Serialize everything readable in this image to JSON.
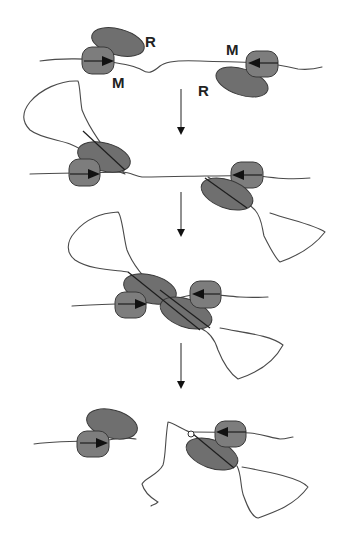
{
  "figure": {
    "type": "schematic",
    "colors": {
      "protein_fill": "#6f6f6f",
      "outline": "#3a3a3a",
      "dna": "#4a4a4a",
      "background": "#ffffff"
    },
    "labels": {
      "r_left": "R",
      "m_left": "M",
      "m_right": "M",
      "r_right": "R"
    },
    "legend": {
      "R": "restriction subunit",
      "M": "modification subunit"
    },
    "stages": [
      {
        "index": 1,
        "name": "stage-1-binding"
      },
      {
        "index": 2,
        "name": "stage-2-translocation-loops"
      },
      {
        "index": 3,
        "name": "stage-3-collision"
      },
      {
        "index": 4,
        "name": "stage-4-cleavage"
      }
    ],
    "step_arrows": 3
  }
}
